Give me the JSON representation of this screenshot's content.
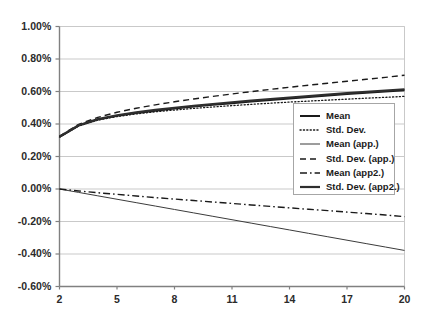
{
  "chart_data": {
    "type": "line",
    "title": "",
    "xlabel": "",
    "ylabel": "",
    "xlim": [
      2,
      20
    ],
    "ylim": [
      -0.006,
      0.01
    ],
    "ylim_percent": [
      -0.6,
      1.0
    ],
    "grid": true,
    "grid_orientation": "horizontal",
    "legend_position": "center-right",
    "x_ticks": [
      "2",
      "5",
      "8",
      "11",
      "14",
      "17",
      "20"
    ],
    "x_tick_values": [
      2,
      5,
      8,
      11,
      14,
      17,
      20
    ],
    "y_ticks": [
      "-0.60%",
      "-0.40%",
      "-0.20%",
      "0.00%",
      "0.20%",
      "0.40%",
      "0.60%",
      "0.80%",
      "1.00%"
    ],
    "y_tick_values": [
      -0.6,
      -0.4,
      -0.2,
      0.0,
      0.2,
      0.4,
      0.6,
      0.8,
      1.0
    ],
    "x": [
      2,
      3,
      4,
      5,
      6,
      7,
      8,
      9,
      10,
      11,
      12,
      13,
      14,
      15,
      16,
      17,
      18,
      19,
      20
    ],
    "series": [
      {
        "name": "Mean",
        "style": "solid",
        "width": 2.0,
        "color": "#1a1a1a",
        "values": [
          0.32,
          0.39,
          0.427,
          0.45,
          0.468,
          0.482,
          0.495,
          0.507,
          0.518,
          0.528,
          0.538,
          0.548,
          0.557,
          0.566,
          0.575,
          0.584,
          0.592,
          0.6,
          0.608
        ]
      },
      {
        "name": "Std. Dev.",
        "style": "dotted",
        "width": 1.3,
        "color": "#1a1a1a",
        "values": [
          0.32,
          0.388,
          0.424,
          0.446,
          0.462,
          0.475,
          0.486,
          0.496,
          0.505,
          0.513,
          0.521,
          0.528,
          0.535,
          0.541,
          0.547,
          0.553,
          0.559,
          0.564,
          0.57
        ]
      },
      {
        "name": "Mean (app.)",
        "style": "solid",
        "width": 1.0,
        "color": "#3b3b3b",
        "values": [
          0.0,
          -0.021,
          -0.042,
          -0.063,
          -0.084,
          -0.105,
          -0.126,
          -0.147,
          -0.168,
          -0.189,
          -0.21,
          -0.231,
          -0.252,
          -0.273,
          -0.294,
          -0.315,
          -0.336,
          -0.357,
          -0.378
        ]
      },
      {
        "name": "Std. Dev. (app.)",
        "style": "dashed",
        "width": 1.4,
        "color": "#1a1a1a",
        "values": [
          0.325,
          0.398,
          0.441,
          0.472,
          0.497,
          0.518,
          0.537,
          0.554,
          0.57,
          0.585,
          0.599,
          0.613,
          0.626,
          0.639,
          0.651,
          0.663,
          0.675,
          0.687,
          0.7
        ]
      },
      {
        "name": "Mean (app2.)",
        "style": "dashdot",
        "width": 1.4,
        "color": "#1a1a1a",
        "values": [
          0.0,
          -0.012,
          -0.023,
          -0.033,
          -0.043,
          -0.053,
          -0.062,
          -0.071,
          -0.08,
          -0.089,
          -0.098,
          -0.107,
          -0.116,
          -0.125,
          -0.133,
          -0.142,
          -0.151,
          -0.16,
          -0.17
        ]
      },
      {
        "name": "Std. Dev. (app2.)",
        "style": "solid",
        "width": 2.2,
        "color": "#2e2e2e",
        "values": [
          0.322,
          0.392,
          0.43,
          0.454,
          0.472,
          0.487,
          0.5,
          0.512,
          0.523,
          0.534,
          0.544,
          0.554,
          0.563,
          0.572,
          0.581,
          0.59,
          0.598,
          0.606,
          0.614
        ]
      }
    ]
  },
  "legend": {
    "items": [
      {
        "label": "Mean"
      },
      {
        "label": "Std. Dev."
      },
      {
        "label": "Mean (app.)"
      },
      {
        "label": "Std. Dev. (app.)"
      },
      {
        "label": "Mean (app2.)"
      },
      {
        "label": "Std. Dev. (app2.)"
      }
    ]
  },
  "colors": {
    "axis": "#808080",
    "grid": "#c9c9c9",
    "text": "#2b2b2b",
    "plot_background": "#ffffff",
    "legend_border": "#a6a6a6"
  }
}
